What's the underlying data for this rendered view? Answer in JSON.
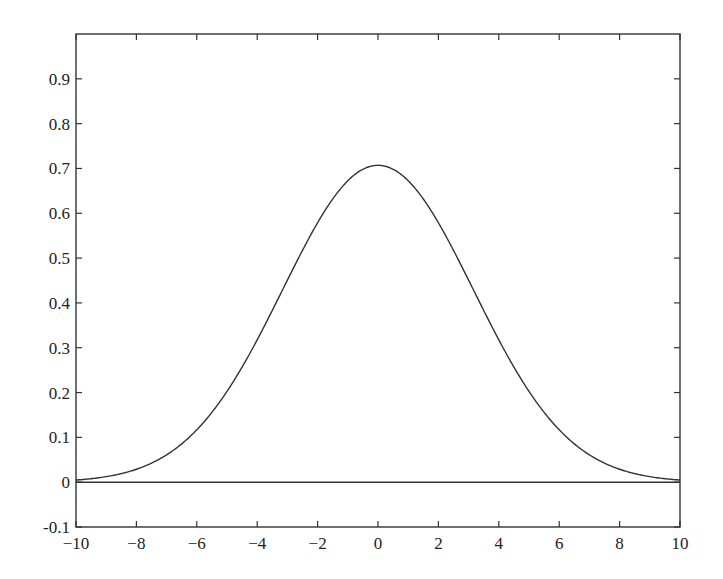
{
  "chart_data": {
    "type": "line",
    "title": "",
    "xlabel": "",
    "ylabel": "",
    "xlim": [
      -10,
      10
    ],
    "ylim": [
      -0.1,
      1.0
    ],
    "grid": false,
    "legend": null,
    "x_ticks": [
      -10,
      -8,
      -6,
      -4,
      -2,
      0,
      2,
      4,
      6,
      8,
      10
    ],
    "x_tick_labels": [
      "−10",
      "−8",
      "−6",
      "−4",
      "−2",
      "0",
      "2",
      "4",
      "6",
      "8",
      "10"
    ],
    "y_ticks": [
      -0.1,
      0,
      0.1,
      0.2,
      0.3,
      0.4,
      0.5,
      0.6,
      0.7,
      0.8,
      0.9
    ],
    "y_tick_labels": [
      "-0.1",
      "0",
      "0.1",
      "0.2",
      "0.3",
      "0.4",
      "0.5",
      "0.6",
      "0.7",
      "0.8",
      "0.9"
    ],
    "series": [
      {
        "name": "gaussian-curve",
        "color": "#333333",
        "x": [
          -10,
          -9,
          -8,
          -7,
          -6,
          -5,
          -4,
          -3,
          -2,
          -1,
          0,
          1,
          2,
          3,
          4,
          5,
          6,
          7,
          8,
          9,
          10
        ],
        "values": [
          0.005,
          0.012,
          0.029,
          0.053,
          0.117,
          0.203,
          0.318,
          0.451,
          0.579,
          0.673,
          0.707,
          0.673,
          0.579,
          0.451,
          0.318,
          0.203,
          0.117,
          0.053,
          0.029,
          0.012,
          0.005
        ]
      },
      {
        "name": "zero-line",
        "color": "#333333",
        "x": [
          -10,
          10
        ],
        "values": [
          0,
          0
        ]
      }
    ],
    "curve_params": {
      "peak": 0.707,
      "center": 0,
      "variance": 10
    }
  }
}
